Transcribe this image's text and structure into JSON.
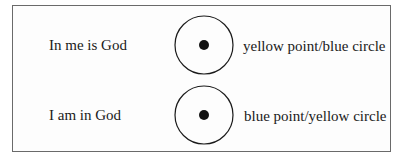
{
  "diagram": {
    "rows": [
      {
        "left_label": "In me is God",
        "right_label": "yellow point/blue circle"
      },
      {
        "left_label": "I am in God",
        "right_label": "blue point/yellow circle"
      }
    ],
    "colors": {
      "stroke": "#1a1a1a",
      "frame": "#6a6a6a",
      "background": "#ffffff"
    }
  }
}
